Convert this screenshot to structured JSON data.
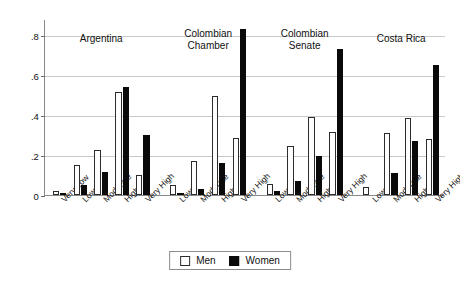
{
  "chart_data": {
    "type": "bar",
    "title": "",
    "subtitle": "",
    "xlabel": "",
    "ylabel": "",
    "ylim": [
      0,
      0.88
    ],
    "yticks": [
      0,
      0.2,
      0.4,
      0.6,
      0.8
    ],
    "ytick_labels": [
      "0",
      ".2",
      ".4",
      ".6",
      ".8"
    ],
    "grid": true,
    "legend_position": "bottom-center",
    "series": [
      {
        "name": "Men",
        "color": "#ffffff",
        "edge": "#2c2c2c"
      },
      {
        "name": "Women",
        "color": "#0a0a0a",
        "edge": "#0a0a0a"
      }
    ],
    "groups": [
      {
        "label": "Argentina",
        "label_lines": [
          "Argentina"
        ],
        "categories": [
          "Very Low",
          "Low",
          "Moderate",
          "High",
          "Very High"
        ],
        "values": {
          "Men": [
            0.02,
            0.15,
            0.225,
            0.515,
            0.1
          ],
          "Women": [
            0.008,
            0.05,
            0.115,
            0.54,
            0.3
          ]
        }
      },
      {
        "label": "Colombian Chamber",
        "label_lines": [
          "Colombian",
          "Chamber"
        ],
        "categories": [
          "Low",
          "Moderate",
          "High",
          "Very High"
        ],
        "values": {
          "Men": [
            0.05,
            0.17,
            0.495,
            0.285
          ],
          "Women": [
            0.005,
            0.03,
            0.16,
            0.83
          ]
        }
      },
      {
        "label": "Colombian Senate",
        "label_lines": [
          "Colombian",
          "Senate"
        ],
        "categories": [
          "Low",
          "Moderate",
          "High",
          "Very High"
        ],
        "values": {
          "Men": [
            0.055,
            0.245,
            0.39,
            0.315
          ],
          "Women": [
            0.02,
            0.07,
            0.195,
            0.73
          ]
        }
      },
      {
        "label": "Costa Rica",
        "label_lines": [
          "Costa Rica"
        ],
        "categories": [
          "Low",
          "Moderate",
          "High",
          "Very High"
        ],
        "values": {
          "Men": [
            0.04,
            0.31,
            0.385,
            0.28
          ],
          "Women": [
            0.0,
            0.11,
            0.27,
            0.65
          ]
        }
      }
    ]
  },
  "legend": {
    "men_label": "Men",
    "women_label": "Women"
  }
}
